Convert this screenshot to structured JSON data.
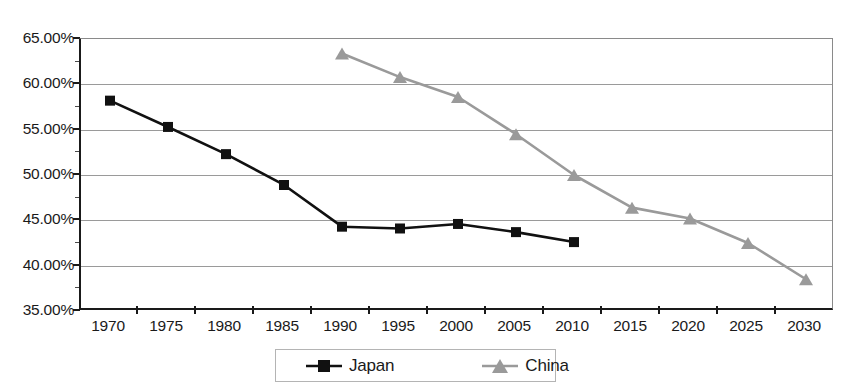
{
  "chart_data": {
    "type": "line",
    "title": "",
    "xlabel": "",
    "ylabel": "",
    "grid": true,
    "legend_position": "bottom-center",
    "categories": [
      1970,
      1975,
      1980,
      1985,
      1990,
      1995,
      2000,
      2005,
      2010,
      2015,
      2020,
      2025,
      2030
    ],
    "x_tick_labels": [
      "1970",
      "1975",
      "1980",
      "1985",
      "1990",
      "1995",
      "2000",
      "2005",
      "2010",
      "2015",
      "2020",
      "2025",
      "2030"
    ],
    "y_tick_labels": [
      "65.00%",
      "60.00%",
      "55.00%",
      "50.00%",
      "45.00%",
      "40.00%",
      "35.00%"
    ],
    "y_tick_values": [
      65,
      60,
      55,
      50,
      45,
      40,
      35
    ],
    "ylim": [
      35,
      65
    ],
    "xlim": [
      1970,
      2030
    ],
    "series": [
      {
        "name": "Japan",
        "color": "#111111",
        "marker": "square",
        "x": [
          1970,
          1975,
          1980,
          1985,
          1990,
          1995,
          2000,
          2005,
          2010
        ],
        "values": [
          58.2,
          55.3,
          52.3,
          48.9,
          44.3,
          44.1,
          44.6,
          43.7,
          42.6
        ]
      },
      {
        "name": "China",
        "color": "#9a9a9a",
        "marker": "triangle",
        "x": [
          1990,
          1995,
          2000,
          2005,
          2010,
          2015,
          2020,
          2025,
          2030
        ],
        "values": [
          63.4,
          60.8,
          58.6,
          54.5,
          50.0,
          46.4,
          45.2,
          42.5,
          38.5
        ]
      }
    ]
  },
  "legend": {
    "items": [
      {
        "label": "Japan",
        "color": "#111111",
        "marker": "square"
      },
      {
        "label": "China",
        "color": "#9a9a9a",
        "marker": "triangle"
      }
    ]
  },
  "colors": {
    "japan": "#111111",
    "china": "#9a9a9a",
    "gridline": "#9a9a9a",
    "axis": "#1a1a1a",
    "background": "#ffffff"
  }
}
